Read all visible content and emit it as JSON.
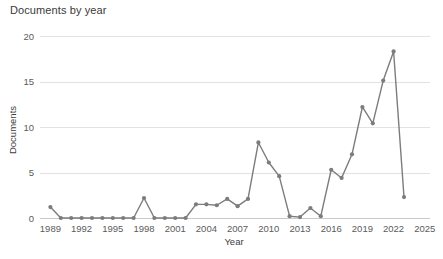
{
  "chart_data": {
    "type": "line",
    "title": "Documents by year",
    "xlabel": "Year",
    "ylabel": "Documents",
    "xlim": [
      1988,
      2025.5
    ],
    "ylim": [
      0,
      21
    ],
    "grid": true,
    "legend": null,
    "marker": "circle",
    "line_color": "#7c7c7c",
    "grid_color": "#e2e2e2",
    "x_tick_labels": [
      "1989",
      "1992",
      "1995",
      "1998",
      "2001",
      "2004",
      "2007",
      "2010",
      "2013",
      "2016",
      "2019",
      "2022",
      "2025"
    ],
    "x_tick_values": [
      1989,
      1992,
      1995,
      1998,
      2001,
      2004,
      2007,
      2010,
      2013,
      2016,
      2019,
      2022,
      2025
    ],
    "y_tick_labels": [
      "0",
      "5",
      "10",
      "15",
      "20"
    ],
    "y_tick_values": [
      0,
      5,
      10,
      15,
      20
    ],
    "x": [
      1989,
      1990,
      1991,
      1992,
      1993,
      1994,
      1995,
      1996,
      1997,
      1998,
      1999,
      2000,
      2001,
      2002,
      2003,
      2004,
      2005,
      2006,
      2007,
      2008,
      2009,
      2010,
      2011,
      2012,
      2013,
      2014,
      2015,
      2016,
      2017,
      2018,
      2019,
      2020,
      2021,
      2022,
      2023
    ],
    "values": [
      1.2,
      0,
      0,
      0,
      0,
      0,
      0,
      0,
      0,
      2.2,
      0,
      0,
      0,
      0,
      1.5,
      1.5,
      1.4,
      2.1,
      1.3,
      2.1,
      8.3,
      6.1,
      4.6,
      0.2,
      0.1,
      1.1,
      0.2,
      5.3,
      4.4,
      7.0,
      12.2,
      10.4,
      15.1,
      18.3,
      2.3
    ],
    "series_name": "Documents"
  },
  "page": {
    "background": "#ffffff"
  }
}
